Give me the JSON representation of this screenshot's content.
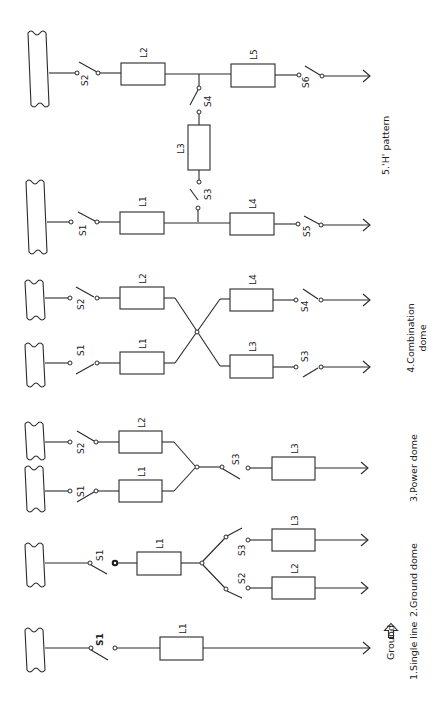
{
  "diagram": {
    "orientation": "rotated 90 degrees counter-clockwise",
    "colors": {
      "line": "#2a2a2a",
      "background": "#ffffff"
    },
    "legend": {
      "ground_label": "Ground",
      "ground_icon": "outline-arrow-icon"
    },
    "panels": [
      {
        "id": "single-line",
        "caption": "1.Single line",
        "components": {
          "switches": [
            "S1"
          ],
          "loads": [
            "L1"
          ]
        }
      },
      {
        "id": "ground-dome",
        "caption": "2.Ground dome",
        "components": {
          "switches": [
            "S1",
            "S2",
            "S3"
          ],
          "loads": [
            "L1",
            "L2",
            "L3"
          ]
        }
      },
      {
        "id": "power-dome",
        "caption": "3.Power dome",
        "components": {
          "switches": [
            "S1",
            "S2",
            "S3"
          ],
          "loads": [
            "L1",
            "L2",
            "L3"
          ]
        }
      },
      {
        "id": "combination-dome",
        "caption_line1": "4.Combination",
        "caption_line2": "dome",
        "components": {
          "switches": [
            "S1",
            "S2",
            "S3",
            "S4"
          ],
          "loads": [
            "L1",
            "L2",
            "L3",
            "L4"
          ]
        }
      },
      {
        "id": "h-pattern",
        "caption": "5.'H' pattern",
        "components": {
          "switches": [
            "S1",
            "S2",
            "S3",
            "S4",
            "S5",
            "S6"
          ],
          "loads": [
            "L1",
            "L2",
            "L3",
            "L4",
            "L5"
          ]
        }
      }
    ]
  }
}
